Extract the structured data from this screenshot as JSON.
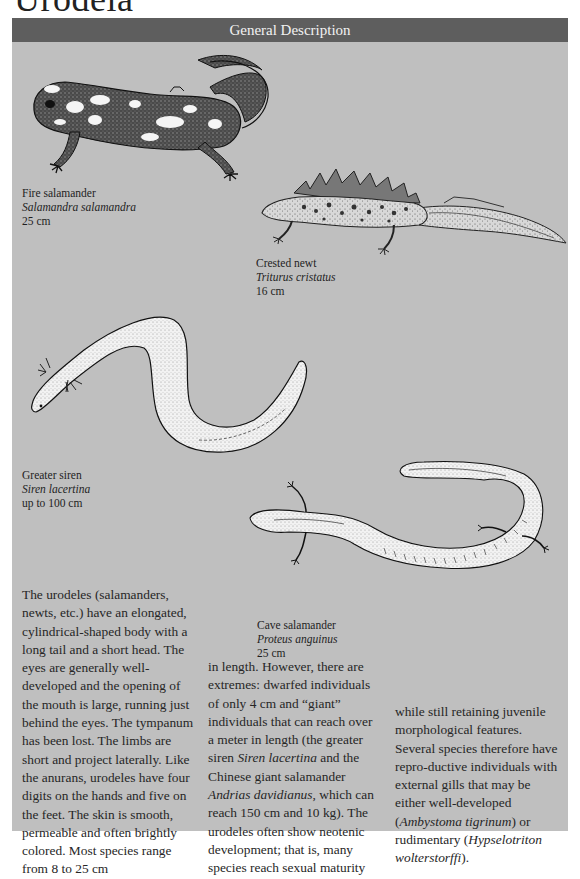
{
  "page": {
    "title": "Urodela"
  },
  "panel": {
    "header": "General Description",
    "background_color": "#bfbfbf",
    "header_color": "#5e5e5e"
  },
  "species": [
    {
      "id": "fire-salamander",
      "common_name": "Fire salamander",
      "latin_name": "Salamandra salamandra",
      "size": "25 cm"
    },
    {
      "id": "crested-newt",
      "common_name": "Crested newt",
      "latin_name": "Triturus cristatus",
      "size": "16 cm"
    },
    {
      "id": "greater-siren",
      "common_name": "Greater siren",
      "latin_name": "Siren lacertina",
      "size": "up to 100 cm"
    },
    {
      "id": "cave-salamander",
      "common_name": "Cave salamander",
      "latin_name": "Proteus anguinus",
      "size": "25 cm"
    }
  ],
  "body": {
    "col1": "The urodeles (salamanders, newts, etc.) have an elongated, cylindrical-shaped body with a long tail and a short head. The eyes are generally well-developed and the opening of the mouth is large, running just behind the eyes. The tympanum has been lost. The limbs are short and project laterally. Like the anurans, urodeles have four digits on the hands and five on the feet. The skin is smooth, permeable and often brightly colored. Most species range from 8 to 25 cm",
    "col2_a": "in length. However, there are extremes: dwarfed individuals of only 4 cm and “giant” individuals that can reach over a meter in length (the greater siren ",
    "col2_italic1": "Siren lacertina",
    "col2_b": " and the Chinese giant salamander ",
    "col2_italic2": "Andrias davidianus",
    "col2_c": ", which can reach 150 cm and 10 kg). The urodeles often show neotenic development; that is, many species reach sexual maturity",
    "col3_a": "while still retaining juvenile morphological features. Several species therefore have repro-ductive individuals with external gills that may be either well-developed (",
    "col3_italic1": "Ambystoma tigrinum",
    "col3_b": ") or rudimentary (",
    "col3_italic2": "Hypselotriton wolterstorffi",
    "col3_c": ")."
  },
  "illustrations": {
    "fire_salamander": "fire-salamander-drawing",
    "crested_newt": "crested-newt-drawing",
    "greater_siren": "greater-siren-drawing",
    "cave_salamander": "cave-salamander-drawing"
  }
}
